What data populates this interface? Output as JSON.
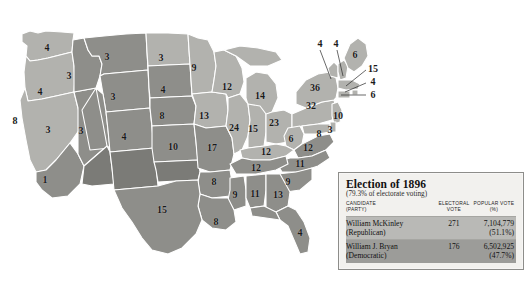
{
  "map": {
    "title": "United States presidential election map of 1896",
    "colors": {
      "mckinley_fill": "#b2b2ae",
      "bryan_fill": "#8e8e8a",
      "territory_fill": "#7b7b77",
      "border": "#ffffff",
      "background": "#ffffff",
      "label_text": "#1a1a1a"
    },
    "states": [
      {
        "name": "Washington",
        "ev": "4",
        "winner": "mckinley",
        "x": 47,
        "y": 48
      },
      {
        "name": "Oregon",
        "ev": "4",
        "winner": "mckinley",
        "x": 40,
        "y": 92
      },
      {
        "name": "California",
        "ev": "8",
        "winner": "mckinley",
        "x": 15,
        "y": 121
      },
      {
        "name": "California-2",
        "ev": "1",
        "winner": "bryan",
        "x": 45,
        "y": 180
      },
      {
        "name": "Nevada",
        "ev": "3",
        "winner": "bryan",
        "x": 48,
        "y": 130
      },
      {
        "name": "Idaho",
        "ev": "3",
        "winner": "bryan",
        "x": 69,
        "y": 76
      },
      {
        "name": "Montana",
        "ev": "3",
        "winner": "bryan",
        "x": 107,
        "y": 57
      },
      {
        "name": "Wyoming",
        "ev": "3",
        "winner": "bryan",
        "x": 113,
        "y": 97
      },
      {
        "name": "Utah",
        "ev": "3",
        "winner": "bryan",
        "x": 81,
        "y": 131
      },
      {
        "name": "Colorado",
        "ev": "4",
        "winner": "bryan",
        "x": 124,
        "y": 137
      },
      {
        "name": "North Dakota",
        "ev": "3",
        "winner": "mckinley",
        "x": 161,
        "y": 58
      },
      {
        "name": "South Dakota",
        "ev": "4",
        "winner": "bryan",
        "x": 163,
        "y": 90
      },
      {
        "name": "Nebraska",
        "ev": "8",
        "winner": "bryan",
        "x": 162,
        "y": 116
      },
      {
        "name": "Kansas",
        "ev": "10",
        "winner": "bryan",
        "x": 173,
        "y": 147
      },
      {
        "name": "Minnesota",
        "ev": "9",
        "winner": "mckinley",
        "x": 194,
        "y": 68
      },
      {
        "name": "Iowa",
        "ev": "13",
        "winner": "mckinley",
        "x": 204,
        "y": 116
      },
      {
        "name": "Missouri",
        "ev": "17",
        "winner": "bryan",
        "x": 212,
        "y": 148
      },
      {
        "name": "Wisconsin",
        "ev": "12",
        "winner": "mckinley",
        "x": 227,
        "y": 87
      },
      {
        "name": "Michigan",
        "ev": "14",
        "winner": "mckinley",
        "x": 260,
        "y": 96
      },
      {
        "name": "Illinois",
        "ev": "24",
        "winner": "mckinley",
        "x": 234,
        "y": 128
      },
      {
        "name": "Indiana",
        "ev": "15",
        "winner": "mckinley",
        "x": 253,
        "y": 129
      },
      {
        "name": "Ohio",
        "ev": "23",
        "winner": "mckinley",
        "x": 274,
        "y": 123
      },
      {
        "name": "West Virginia",
        "ev": "6",
        "winner": "mckinley",
        "x": 291,
        "y": 139
      },
      {
        "name": "Kentucky",
        "ev": "12",
        "winner": "mckinley",
        "x": 266,
        "y": 152
      },
      {
        "name": "Virginia",
        "ev": "12",
        "winner": "bryan",
        "x": 308,
        "y": 148
      },
      {
        "name": "Maryland",
        "ev": "8",
        "winner": "mckinley",
        "x": 319,
        "y": 134
      },
      {
        "name": "Delaware",
        "ev": "3",
        "winner": "mckinley",
        "x": 330,
        "y": 130
      },
      {
        "name": "Pennsylvania",
        "ev": "32",
        "winner": "mckinley",
        "x": 311,
        "y": 106
      },
      {
        "name": "New York",
        "ev": "36",
        "winner": "mckinley",
        "x": 315,
        "y": 88
      },
      {
        "name": "Vermont",
        "ev": "4",
        "winner": "mckinley",
        "x": 320,
        "y": 44
      },
      {
        "name": "New Hampshire",
        "ev": "4",
        "winner": "mckinley",
        "x": 336,
        "y": 44
      },
      {
        "name": "Maine",
        "ev": "6",
        "winner": "mckinley",
        "x": 355,
        "y": 55
      },
      {
        "name": "Massachusetts",
        "ev": "15",
        "winner": "mckinley",
        "x": 373,
        "y": 69
      },
      {
        "name": "Rhode Island",
        "ev": "4",
        "winner": "mckinley",
        "x": 373,
        "y": 82
      },
      {
        "name": "Connecticut",
        "ev": "6",
        "winner": "mckinley",
        "x": 373,
        "y": 95
      },
      {
        "name": "New Jersey",
        "ev": "10",
        "winner": "mckinley",
        "x": 338,
        "y": 116
      },
      {
        "name": "North Carolina",
        "ev": "11",
        "winner": "bryan",
        "x": 300,
        "y": 164
      },
      {
        "name": "Tennessee",
        "ev": "12",
        "winner": "bryan",
        "x": 256,
        "y": 168
      },
      {
        "name": "Arkansas",
        "ev": "8",
        "winner": "bryan",
        "x": 214,
        "y": 182
      },
      {
        "name": "South Carolina",
        "ev": "9",
        "winner": "bryan",
        "x": 288,
        "y": 182
      },
      {
        "name": "Mississippi",
        "ev": "9",
        "winner": "bryan",
        "x": 235,
        "y": 195
      },
      {
        "name": "Alabama",
        "ev": "11",
        "winner": "bryan",
        "x": 255,
        "y": 194
      },
      {
        "name": "Georgia",
        "ev": "13",
        "winner": "bryan",
        "x": 278,
        "y": 195
      },
      {
        "name": "Louisiana",
        "ev": "8",
        "winner": "bryan",
        "x": 216,
        "y": 222
      },
      {
        "name": "Texas",
        "ev": "15",
        "winner": "bryan",
        "x": 162,
        "y": 210
      },
      {
        "name": "Florida",
        "ev": "4",
        "winner": "bryan",
        "x": 300,
        "y": 233
      }
    ],
    "leader_lines": [
      {
        "label": "Vermont",
        "x1": 320,
        "y1": 50,
        "x2": 331,
        "y2": 78
      },
      {
        "label": "New Hampshire",
        "x1": 337,
        "y1": 50,
        "x2": 343,
        "y2": 76
      },
      {
        "label": "Massachusetts",
        "x1": 366,
        "y1": 70,
        "x2": 345,
        "y2": 86
      },
      {
        "label": "Rhode Island",
        "x1": 366,
        "y1": 83,
        "x2": 344,
        "y2": 91
      },
      {
        "label": "Connecticut",
        "x1": 366,
        "y1": 95,
        "x2": 341,
        "y2": 95
      }
    ]
  },
  "legend": {
    "title": "Election of 1896",
    "subtitle": "(79.3% of electorate voting)",
    "columns": {
      "candidate": "CANDIDATE",
      "party": "(PARTY)",
      "electoral": "ELECTORAL",
      "electoral_2": "VOTE",
      "popular": "POPULAR VOTE",
      "popular_2": "(%)"
    },
    "rows": [
      {
        "candidate": "William McKinley",
        "party": "(Republican)",
        "electoral_vote": "271",
        "popular_vote": "7,104,779",
        "popular_pct": "(51.1%)",
        "swatch": "#b9b9b6"
      },
      {
        "candidate": "William J. Bryan",
        "party": "(Democratic)",
        "electoral_vote": "176",
        "popular_vote": "6,502,925",
        "popular_pct": "(47.7%)",
        "swatch": "#9c9c99"
      }
    ]
  }
}
